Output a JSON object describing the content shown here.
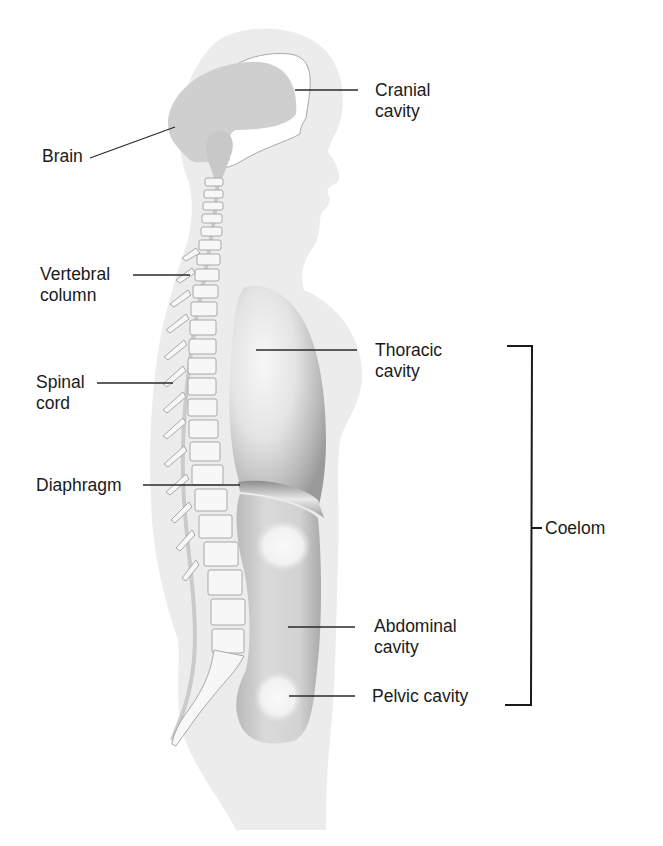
{
  "diagram": {
    "type": "anatomical-sagittal-section",
    "colors": {
      "body_silhouette": "#ececec",
      "brain": "#cfcfcf",
      "cavity_dark": "#9a9a9a",
      "cavity_mid": "#c4c4c4",
      "cavity_light": "#f4f4f4",
      "vertebra_outline": "#a8a8a8",
      "leader_line": "#2a2a2a",
      "text": "#1a1a1a"
    },
    "labels": {
      "brain": {
        "lines": [
          "Brain"
        ]
      },
      "cranial_cavity": {
        "lines": [
          "Cranial",
          "cavity"
        ]
      },
      "vertebral_column": {
        "lines": [
          "Vertebral",
          "column"
        ]
      },
      "spinal_cord": {
        "lines": [
          "Spinal",
          "cord"
        ]
      },
      "thoracic_cavity": {
        "lines": [
          "Thoracic",
          "cavity"
        ]
      },
      "diaphragm": {
        "lines": [
          "Diaphragm"
        ]
      },
      "coelom": {
        "lines": [
          "Coelom"
        ]
      },
      "abdominal_cavity": {
        "lines": [
          "Abdominal",
          "cavity"
        ]
      },
      "pelvic_cavity": {
        "lines": [
          "Pelvic cavity"
        ]
      }
    },
    "bracket": {
      "label": "Coelom",
      "spans": [
        "Thoracic cavity",
        "Abdominal cavity",
        "Pelvic cavity"
      ]
    }
  }
}
